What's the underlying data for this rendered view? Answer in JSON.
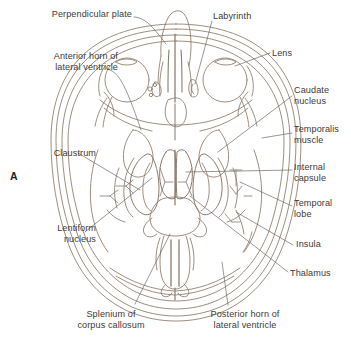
{
  "figure": {
    "panel_letter": "A",
    "type": "anatomical-line-drawing",
    "view": "axial cross-section of head at level of lateral ventricles",
    "stroke_color": "#8a7a68",
    "text_color": "#3d3a38",
    "background_color": "#ffffff"
  },
  "labels": [
    {
      "id": "perpendicular-plate",
      "text": "Perpendicular plate",
      "align": "right",
      "x": 12,
      "y": 9,
      "width": 120
    },
    {
      "id": "labyrinth",
      "text": "Labyrinth",
      "align": "left",
      "x": 213,
      "y": 11,
      "width": 70
    },
    {
      "id": "lens",
      "text": "Lens",
      "align": "left",
      "x": 272,
      "y": 48,
      "width": 50
    },
    {
      "id": "anterior-horn-of-lateral-ventricle",
      "text": "Anterior horn of\nlateral ventricle",
      "align": "right",
      "x": 14,
      "y": 51,
      "width": 104
    },
    {
      "id": "caudate-nucleus",
      "text": "Caudate\nnucleus",
      "align": "left",
      "x": 294,
      "y": 85,
      "width": 56
    },
    {
      "id": "temporalis-muscle",
      "text": "Temporalis\nmuscle",
      "align": "left",
      "x": 294,
      "y": 124,
      "width": 56
    },
    {
      "id": "claustrum",
      "text": "Claustrum",
      "align": "right",
      "x": 10,
      "y": 148,
      "width": 86
    },
    {
      "id": "internal-capsule",
      "text": "Internal\ncapsule",
      "align": "left",
      "x": 294,
      "y": 162,
      "width": 56
    },
    {
      "id": "temporal-lobe",
      "text": "Temporal\nlobe",
      "align": "left",
      "x": 294,
      "y": 198,
      "width": 56
    },
    {
      "id": "lentiform-nucleus",
      "text": "Lentiform\nnucleus",
      "align": "right",
      "x": 16,
      "y": 223,
      "width": 80
    },
    {
      "id": "insula",
      "text": "Insula",
      "align": "left",
      "x": 296,
      "y": 239,
      "width": 50
    },
    {
      "id": "thalamus",
      "text": "Thalamus",
      "align": "left",
      "x": 290,
      "y": 268,
      "width": 58
    },
    {
      "id": "splenium-of-corpus-callosum",
      "text": "Splenium of\ncorpus callosum",
      "align": "center",
      "x": 62,
      "y": 309,
      "width": 98
    },
    {
      "id": "posterior-horn-of-lateral-ventricle",
      "text": "Posterior horn of\nlateral ventricle",
      "align": "center",
      "x": 193,
      "y": 309,
      "width": 104
    }
  ]
}
